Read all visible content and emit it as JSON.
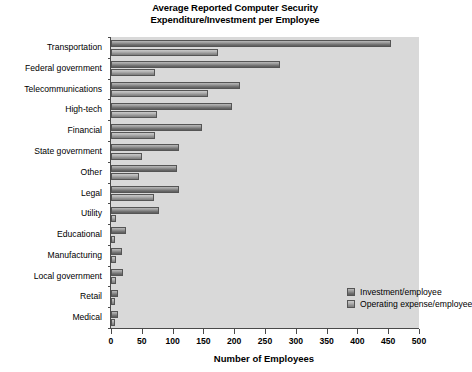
{
  "chart_data": {
    "type": "bar",
    "orientation": "horizontal",
    "title": "Average Reported Computer Security Expenditure/Investment per Employee",
    "title_line1": "Average Reported Computer Security",
    "title_line2": "Expenditure/Investment per Employee",
    "xlabel": "Number of Employees",
    "ylabel": "",
    "xlim": [
      0,
      500
    ],
    "xticks": [
      0,
      50,
      100,
      150,
      200,
      250,
      300,
      350,
      400,
      450,
      500
    ],
    "xtick_labels": [
      "0",
      "50",
      "100",
      "150",
      "200",
      "250",
      "300",
      "350",
      "400",
      "450",
      "500"
    ],
    "grid": false,
    "legend_position": "inside-right",
    "plot_background": "#d9d9d9",
    "categories": [
      "Transportation",
      "Federal government",
      "Telecommunications",
      "High-tech",
      "Financial",
      "State government",
      "Other",
      "Legal",
      "Utility",
      "Educational",
      "Manufacturing",
      "Local government",
      "Retail",
      "Medical"
    ],
    "series": [
      {
        "name": "Investment/employee",
        "color": "#7a7a7a",
        "values": [
          455,
          275,
          210,
          196,
          148,
          110,
          107,
          110,
          78,
          25,
          18,
          20,
          12,
          12
        ]
      },
      {
        "name": "Operating expense/employee",
        "color": "#a8a8a8",
        "values": [
          173,
          71,
          157,
          74,
          71,
          50,
          46,
          69,
          8,
          7,
          8,
          8,
          7,
          6
        ]
      }
    ]
  }
}
